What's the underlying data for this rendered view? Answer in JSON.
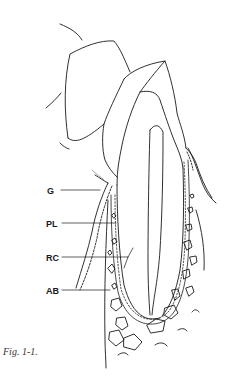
{
  "figure": {
    "caption": "Fig. 1-1.",
    "labels": [
      {
        "id": "G",
        "text": "G",
        "x": 47,
        "y": 186
      },
      {
        "id": "PL",
        "text": "PL",
        "x": 46,
        "y": 219
      },
      {
        "id": "RC",
        "text": "RC",
        "x": 46,
        "y": 253
      },
      {
        "id": "AB",
        "text": "AB",
        "x": 46,
        "y": 286
      }
    ],
    "colors": {
      "line": "#1a1a1a",
      "background": "#ffffff"
    }
  }
}
